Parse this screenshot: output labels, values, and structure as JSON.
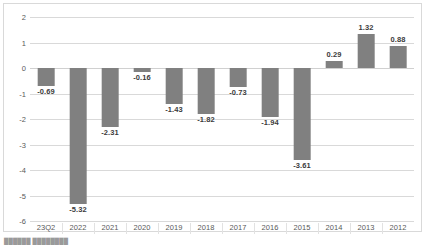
{
  "chart_data": {
    "type": "bar",
    "title": "",
    "subtitle": "",
    "xlabel": "",
    "ylabel": "",
    "categories": [
      "23Q2",
      "2022",
      "2021",
      "2020",
      "2019",
      "2018",
      "2017",
      "2016",
      "2015",
      "2014",
      "2013",
      "2012"
    ],
    "values": [
      -0.69,
      -5.32,
      -2.31,
      -0.16,
      -1.43,
      -1.82,
      -0.73,
      -1.94,
      -3.61,
      0.29,
      1.32,
      0.88
    ],
    "data_labels": [
      "-0.69",
      "-5.32",
      "-2.31",
      "-0.16",
      "-1.43",
      "-1.82",
      "-0.73",
      "-1.94",
      "-3.61",
      "0.29",
      "1.32",
      "0.88"
    ],
    "ylim": [
      -6,
      2
    ],
    "ytick_labels": [
      "2",
      "1",
      "0",
      "-1",
      "-2",
      "-3",
      "-4",
      "-5",
      "-6"
    ],
    "ytick_values": [
      2,
      1,
      0,
      -1,
      -2,
      -3,
      -4,
      -5,
      -6
    ],
    "grid": true,
    "legend": null,
    "series": [
      {
        "name": "",
        "color": "#808080",
        "values": [
          -0.69,
          -5.32,
          -2.31,
          -0.16,
          -1.43,
          -1.82,
          -0.73,
          -1.94,
          -3.61,
          0.29,
          1.32,
          0.88
        ]
      }
    ]
  },
  "colors": {
    "bar": "#808080",
    "gridline": "#d9d9d9",
    "frame": "#d9d9d9",
    "axis_text": "#595959",
    "label_text": "#3b3b3b",
    "background": "#ffffff"
  },
  "caption": {
    "text": "██████ ████████"
  }
}
